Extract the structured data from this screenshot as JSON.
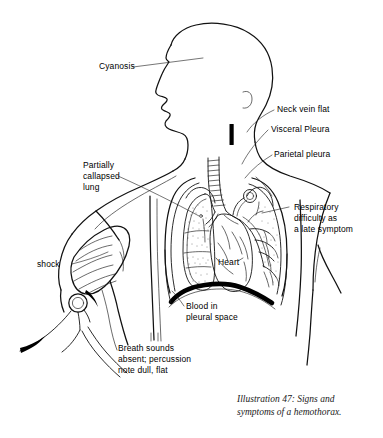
{
  "figure": {
    "caption": "Illustration 47: Signs and\nsymptoms of a hemothorax.",
    "caption_line_1": "Illustration 47: Signs and",
    "caption_line_2": "symptoms of a hemothorax.",
    "background_color": "#ffffff",
    "ink_color": "#111111",
    "blood_color": "#000000",
    "width_px": 383,
    "height_px": 438
  },
  "labels": {
    "cyanosis": "Cyanosis",
    "neck_vein_flat": "Neck vein flat",
    "visceral_pleura": "Visceral Pleura",
    "parietal_pleura": "Parietal pleura",
    "partially_collapsed_lung": "Partially\ncallapsed\nlung",
    "partially_collapsed_lung_line_1": "Partially",
    "partially_collapsed_lung_line_2": "callapsed",
    "partially_collapsed_lung_line_3": "lung",
    "respiratory_difficulty": "Respiratory\ndifficulty as\na late symptom",
    "respiratory_difficulty_line_1": "Respiratory",
    "respiratory_difficulty_line_2": "difficulty as",
    "respiratory_difficulty_line_3": "a late symptom",
    "shock": "shock",
    "heart": "Heart",
    "blood_in_pleural_space": "Blood in\npleural space",
    "blood_in_pleural_space_line_1": "Blood in",
    "blood_in_pleural_space_line_2": "pleural space",
    "breath_sounds": "Breath sounds\nabsent; percussion\nnote dull, flat",
    "breath_sounds_line_1": "Breath sounds",
    "breath_sounds_line_2": "absent; percussion",
    "breath_sounds_line_3": "note dull, flat"
  },
  "anatomy": {
    "head_profile": "head-and-neck-profile-facing-left",
    "trachea": "segmented-trachea",
    "left_lung": "partially-collapsed-stippled-lung",
    "right_lung": "lung-with-bronchial-tree",
    "heart": "heart-silhouette-center-thorax",
    "blood_layer": "thick-black-arc-at-diaphragm",
    "neck_vein_marker": "solid-black-vertical-bar",
    "bp_cuff": "blood-pressure-cuff-on-upper-arm",
    "bulb": "inflation-bulb",
    "tubing": "cuff-tubing"
  }
}
